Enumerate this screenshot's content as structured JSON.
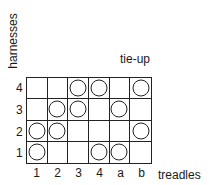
{
  "diagram": {
    "title": "tie-up",
    "y_axis_label": "harnesses",
    "x_axis_label": "treadles",
    "rows": [
      "4",
      "3",
      "2",
      "1"
    ],
    "columns": [
      "1",
      "2",
      "3",
      "4",
      "a",
      "b"
    ],
    "tie_up": [
      {
        "harness": "4",
        "marks": [
          false,
          false,
          true,
          true,
          false,
          true
        ]
      },
      {
        "harness": "3",
        "marks": [
          false,
          true,
          true,
          false,
          true,
          false
        ]
      },
      {
        "harness": "2",
        "marks": [
          true,
          true,
          false,
          false,
          false,
          true
        ]
      },
      {
        "harness": "1",
        "marks": [
          true,
          false,
          false,
          true,
          true,
          false
        ]
      }
    ]
  }
}
